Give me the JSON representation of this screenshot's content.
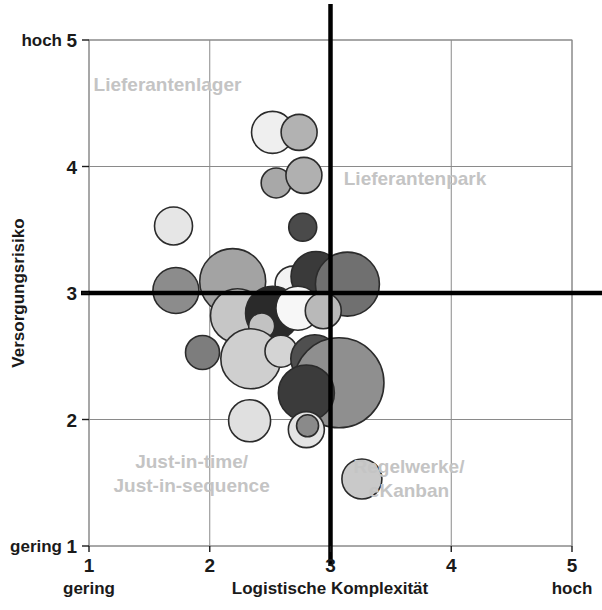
{
  "chart_data": {
    "type": "scatter",
    "title": "",
    "subtitle": "",
    "xlabel": "Logistische Komplexität",
    "ylabel": "Versorgungsrisiko",
    "xlim": [
      1,
      5
    ],
    "ylim": [
      1,
      5
    ],
    "xticks": [
      "1",
      "2",
      "3",
      "4",
      "5"
    ],
    "yticks": [
      "1",
      "2",
      "3",
      "4",
      "5"
    ],
    "x_axis_low_label": "gering",
    "x_axis_high_label": "hoch",
    "y_axis_low_label": "gering",
    "y_axis_high_label": "hoch",
    "grid": true,
    "legend": "none",
    "reference_lines": {
      "x": 3,
      "y": 3,
      "style": "thick-black"
    },
    "quadrant_labels": [
      {
        "id": "q-top-left",
        "text": "Lieferantenlager",
        "x": 1.65,
        "y": 4.6
      },
      {
        "id": "q-top-right",
        "text": "Lieferantenpark",
        "x": 3.7,
        "y": 3.85
      },
      {
        "id": "q-bottom-left",
        "text": "Just-in-time/\nJust-in-sequence",
        "x": 1.85,
        "y": 1.62
      },
      {
        "id": "q-bottom-right",
        "text": "Regelwerke/\neKanban",
        "x": 3.65,
        "y": 1.58
      }
    ],
    "bubble_size_unit": "radius_px",
    "points": [
      {
        "x": 2.52,
        "y": 4.27,
        "r": 21,
        "shade": "#efefef"
      },
      {
        "x": 2.74,
        "y": 4.27,
        "r": 18,
        "shade": "#b2b2b2"
      },
      {
        "x": 2.55,
        "y": 3.87,
        "r": 15,
        "shade": "#a8a8a8"
      },
      {
        "x": 2.78,
        "y": 3.93,
        "r": 18,
        "shade": "#b0b0b0"
      },
      {
        "x": 2.77,
        "y": 3.52,
        "r": 14,
        "shade": "#4a4a4a"
      },
      {
        "x": 1.7,
        "y": 3.53,
        "r": 19,
        "shade": "#e6e6e6"
      },
      {
        "x": 1.72,
        "y": 3.02,
        "r": 23,
        "shade": "#8c8c8c"
      },
      {
        "x": 2.19,
        "y": 3.09,
        "r": 33,
        "shade": "#a3a3a3"
      },
      {
        "x": 2.69,
        "y": 3.07,
        "r": 18,
        "shade": "#f2f2f2"
      },
      {
        "x": 2.88,
        "y": 3.13,
        "r": 25,
        "shade": "#3a3a3a"
      },
      {
        "x": 3.14,
        "y": 3.07,
        "r": 32,
        "shade": "#707070"
      },
      {
        "x": 2.23,
        "y": 2.82,
        "r": 27,
        "shade": "#c6c6c6"
      },
      {
        "x": 2.52,
        "y": 2.84,
        "r": 27,
        "shade": "#2a2a2a"
      },
      {
        "x": 2.73,
        "y": 2.88,
        "r": 22,
        "shade": "#f7f7f7"
      },
      {
        "x": 2.94,
        "y": 2.86,
        "r": 18,
        "shade": "#b9b9b9"
      },
      {
        "x": 2.43,
        "y": 2.74,
        "r": 13,
        "shade": "#c2c2c2"
      },
      {
        "x": 1.94,
        "y": 2.53,
        "r": 17,
        "shade": "#7d7d7d"
      },
      {
        "x": 2.34,
        "y": 2.48,
        "r": 30,
        "shade": "#cfcfcf"
      },
      {
        "x": 2.59,
        "y": 2.54,
        "r": 16,
        "shade": "#d4d4d4"
      },
      {
        "x": 2.87,
        "y": 2.48,
        "r": 24,
        "shade": "#4f4f4f"
      },
      {
        "x": 3.07,
        "y": 2.29,
        "r": 45,
        "shade": "#8f8f8f"
      },
      {
        "x": 2.8,
        "y": 2.21,
        "r": 28,
        "shade": "#3b3b3b"
      },
      {
        "x": 2.33,
        "y": 1.99,
        "r": 21,
        "shade": "#e0e0e0"
      },
      {
        "x": 2.8,
        "y": 1.92,
        "r": 18,
        "shade": "#e4e4e4"
      },
      {
        "x": 2.81,
        "y": 1.95,
        "r": 11,
        "shade": "#8a8a8a"
      },
      {
        "x": 3.26,
        "y": 1.53,
        "r": 20,
        "shade": "#c9c9c9"
      }
    ]
  },
  "axes": {
    "y_top_anchor": "hoch",
    "y_bottom_anchor": "gering",
    "x_left_anchor": "gering",
    "x_right_anchor": "hoch",
    "x_title": "Logistische Komplexität",
    "y_title": "Versorgungsrisiko"
  },
  "colors": {
    "grid": "#8a8a8a",
    "reference_line": "#000000",
    "quadrant_label": "#c4c4c4",
    "text": "#1a1a1a",
    "background": "#ffffff"
  }
}
